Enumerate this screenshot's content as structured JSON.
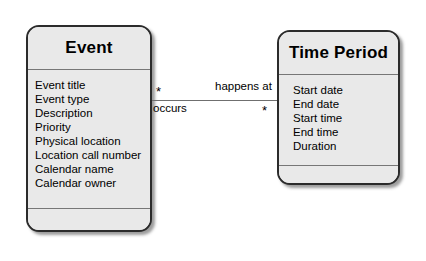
{
  "diagram": {
    "type": "uml-class-diagram",
    "background_color": "#ffffff",
    "classes": [
      {
        "name": "Event",
        "attributes": [
          "Event title",
          "Event type",
          "Description",
          "Priority",
          "Physical location",
          "Location call number",
          "Calendar name",
          "Calendar owner"
        ],
        "operations": [],
        "fill_color": "#e9e9e9",
        "border_color": "#2b2b2b"
      },
      {
        "name": "Time Period",
        "attributes": [
          "Start date",
          "End date",
          "Start time",
          "End time",
          "Duration"
        ],
        "operations": [],
        "fill_color": "#e9e9e9",
        "border_color": "#2b2b2b"
      }
    ],
    "association": {
      "source_role_label": "occurs",
      "target_role_label": "happens at",
      "source_multiplicity": "*",
      "target_multiplicity": "*",
      "line_color": "#6f6f6f"
    }
  }
}
